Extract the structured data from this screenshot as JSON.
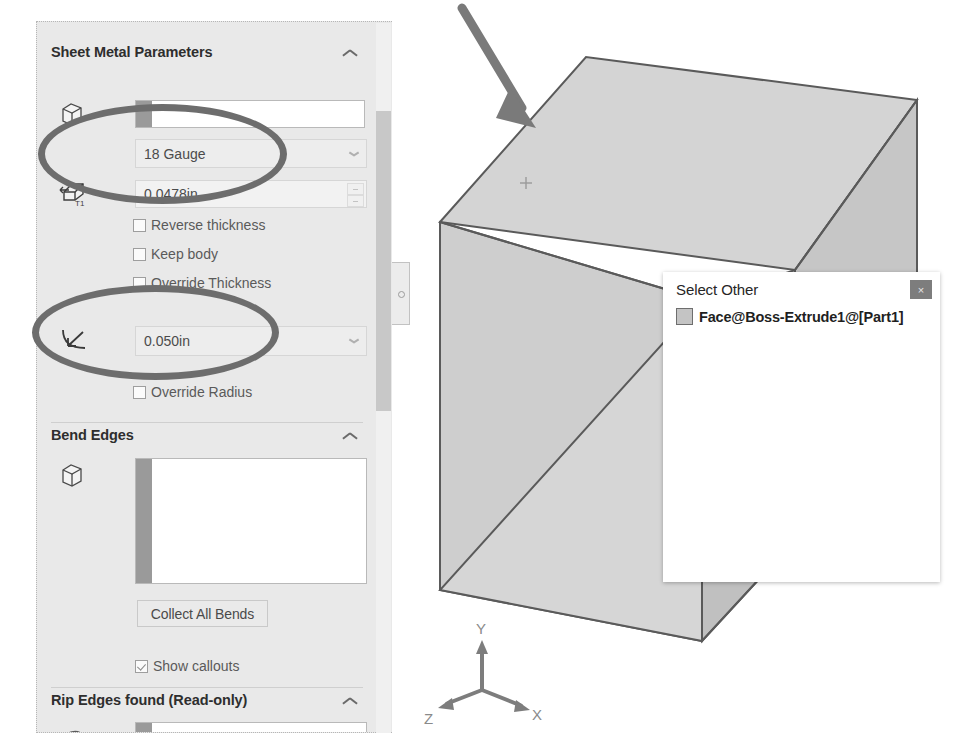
{
  "panel": {
    "name": "sheet-metal-property-manager",
    "sections": [
      {
        "title": "Sheet Metal Parameters"
      },
      {
        "title": "Bend Edges"
      },
      {
        "title": "Rip Edges found (Read-only)"
      }
    ],
    "sheet_metal_parameters": {
      "fixed_face_selection": {
        "icon": "face-select-icon",
        "value": ""
      },
      "gauge_table": {
        "icon": "gauge-table-icon",
        "value": "18 Gauge"
      },
      "thickness": {
        "icon": "thickness-t1-icon",
        "value": "0.0478in"
      },
      "checkboxes": [
        {
          "label": "Reverse thickness",
          "checked": false
        },
        {
          "label": "Keep body",
          "checked": false
        },
        {
          "label": "Override Thickness",
          "checked": false
        }
      ],
      "bend_radius": {
        "icon": "bend-radius-icon",
        "value": "0.050in"
      },
      "override_radius": {
        "label": "Override Radius",
        "checked": false
      }
    },
    "bend_edges": {
      "selection_icon": "edge-select-icon",
      "items": [],
      "collect_button": "Collect All Bends",
      "show_callouts": {
        "label": "Show callouts",
        "checked": true
      }
    },
    "rip_edges": {
      "selection_icon": "rip-edge-icon",
      "items": []
    }
  },
  "select_other": {
    "title": "Select Other",
    "close_label": "×",
    "items": [
      {
        "label": "Face@Boss-Extrude1@[Part1]",
        "swatch_color": "#c4c4c4"
      }
    ]
  },
  "viewport": {
    "triad": {
      "x_label": "X",
      "y_label": "Y",
      "z_label": "Z"
    },
    "cursor": "mouse-select-cursor",
    "annotation_arrow": "pointer-arrow"
  },
  "colors": {
    "panel_background": "#e9e9e9",
    "annotation_gray": "#6d6d6d",
    "model_face_light": "#d9d9d9",
    "model_face_mid": "#cccccc",
    "model_face_dark": "#bdbdbd",
    "model_edge": "#5a5a5a"
  }
}
